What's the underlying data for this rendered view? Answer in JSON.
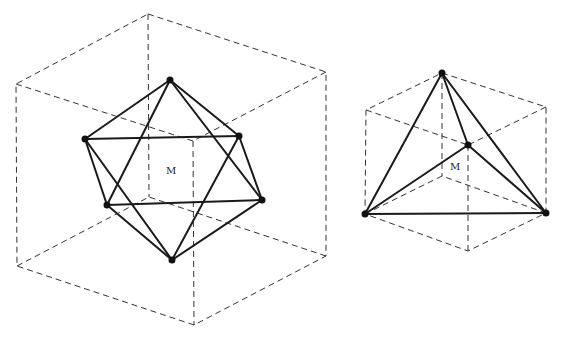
{
  "figures": [
    {
      "name": "icosahedron-in-cube",
      "center_label": "M",
      "cube_outer": [
        [
          148,
          14
        ],
        [
          326,
          72
        ],
        [
          326,
          256
        ],
        [
          194,
          325
        ],
        [
          17,
          266
        ],
        [
          16,
          84
        ]
      ],
      "cube_front_corner": [
        193,
        141
      ],
      "cube_back_corner": [
        149,
        197
      ],
      "vertices": [
        [
          170,
          80
        ],
        [
          239,
          136
        ],
        [
          85,
          139
        ],
        [
          262,
          200
        ],
        [
          107,
          205
        ],
        [
          172,
          260
        ]
      ],
      "edges": [
        [
          0,
          1
        ],
        [
          0,
          2
        ],
        [
          0,
          3
        ],
        [
          0,
          4
        ],
        [
          1,
          2
        ],
        [
          1,
          3
        ],
        [
          1,
          5
        ],
        [
          2,
          4
        ],
        [
          2,
          5
        ],
        [
          3,
          4
        ],
        [
          3,
          5
        ],
        [
          4,
          5
        ]
      ]
    },
    {
      "name": "tetrahedron-in-cube",
      "center_label": "M",
      "cube_outer": [
        [
          442,
          73
        ],
        [
          546,
          107
        ],
        [
          546,
          213
        ],
        [
          468,
          251
        ],
        [
          365,
          214
        ],
        [
          366,
          110
        ]
      ],
      "cube_front_corner": [
        468,
        145
      ],
      "cube_back_corner": [
        442,
        176
      ],
      "vertices": [
        [
          442,
          73
        ],
        [
          468,
          145
        ],
        [
          365,
          214
        ],
        [
          546,
          213
        ]
      ],
      "edges": [
        [
          0,
          1
        ],
        [
          0,
          2
        ],
        [
          0,
          3
        ],
        [
          1,
          2
        ],
        [
          1,
          3
        ],
        [
          2,
          3
        ]
      ]
    }
  ],
  "colors": {
    "line": "#1a1a1a",
    "dashed": "#333333",
    "background": "#ffffff"
  }
}
